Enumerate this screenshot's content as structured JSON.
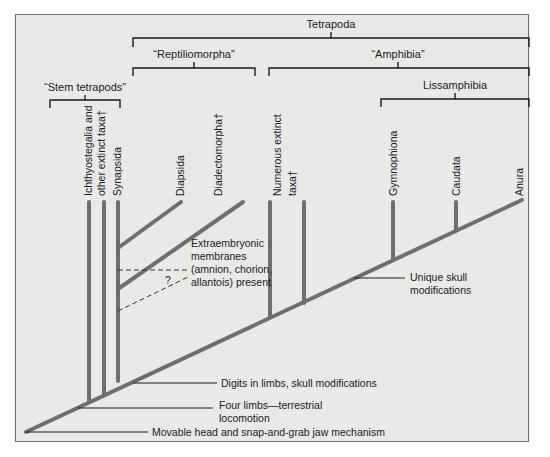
{
  "figure": {
    "type": "cladogram",
    "colors": {
      "background": "#e9e9e7",
      "branch": "#6e6e6e",
      "frame": "#6a6a6a",
      "text": "#1a1a1a"
    },
    "groups": [
      {
        "id": "tetrapoda",
        "label": "Tetrapoda"
      },
      {
        "id": "reptiliomorpha",
        "label": "“Reptiliomorpha”"
      },
      {
        "id": "amphibia",
        "label": "“Amphibia”"
      },
      {
        "id": "stem",
        "label": "“Stem tetrapods”"
      },
      {
        "id": "lissamphibia",
        "label": "Lissamphibia"
      }
    ],
    "taxa": [
      {
        "id": "ichthyostegalia",
        "line1": "Ichthyostegalia and",
        "line2": "other extinct taxa†"
      },
      {
        "id": "synapsida",
        "line1": "Synapsida"
      },
      {
        "id": "diapsida",
        "line1": "Diapsida"
      },
      {
        "id": "diadectomorpha",
        "line1": "Diadectomorpha†"
      },
      {
        "id": "numerous",
        "line1": "Numerous extinct",
        "line2": "taxa†"
      },
      {
        "id": "gymnophiona",
        "line1": "Gymnophiona"
      },
      {
        "id": "caudata",
        "line1": "Caudata"
      },
      {
        "id": "anura",
        "line1": "Anura"
      }
    ],
    "characters": [
      {
        "id": "extraembryonic",
        "lines": [
          "Extraembryonic",
          "membranes",
          "(amnion, chorion,",
          "allantois) present"
        ]
      },
      {
        "id": "unique-skull",
        "lines": [
          "Unique skull",
          "modifications"
        ]
      },
      {
        "id": "digits",
        "lines": [
          "Digits in limbs, skull modifications"
        ]
      },
      {
        "id": "four-limbs",
        "lines": [
          "Four limbs—terrestrial",
          "locomotion"
        ]
      },
      {
        "id": "movable-head",
        "lines": [
          "Movable head and snap-and-grab jaw mechanism"
        ]
      }
    ],
    "uncertain_mark": "?"
  }
}
